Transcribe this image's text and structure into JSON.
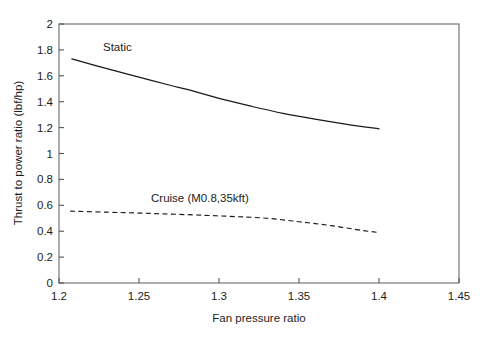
{
  "chart_data": {
    "type": "line",
    "title": "",
    "xlabel": "Fan pressure ratio",
    "ylabel": "Thrust to power ratio (lbf/hp)",
    "xlim": [
      1.2,
      1.45
    ],
    "ylim": [
      0,
      2
    ],
    "xticks": [
      "1.2",
      "1.25",
      "1.3",
      "1.35",
      "1.4",
      "1.45"
    ],
    "xtick_values": [
      1.2,
      1.25,
      1.3,
      1.35,
      1.4,
      1.45
    ],
    "yticks": [
      "0",
      "0.2",
      "0.4",
      "0.6",
      "0.8",
      "1",
      "1.2",
      "1.4",
      "1.6",
      "1.8",
      "2"
    ],
    "ytick_values": [
      0,
      0.2,
      0.4,
      0.6,
      0.8,
      1.0,
      1.2,
      1.4,
      1.6,
      1.8,
      2.0
    ],
    "grid": false,
    "legend": "inline-annotations",
    "series": [
      {
        "name": "Static",
        "style": "solid",
        "color": "#1a1a1a",
        "x": [
          1.208,
          1.23,
          1.25,
          1.27,
          1.28,
          1.3,
          1.32,
          1.34,
          1.36,
          1.38,
          1.4
        ],
        "values": [
          1.73,
          1.655,
          1.59,
          1.525,
          1.495,
          1.425,
          1.365,
          1.31,
          1.265,
          1.225,
          1.19
        ]
      },
      {
        "name": "Cruise (M0.8,35kft)",
        "style": "dashed",
        "color": "#1a1a1a",
        "x": [
          1.207,
          1.23,
          1.25,
          1.27,
          1.29,
          1.31,
          1.33,
          1.35,
          1.37,
          1.39,
          1.4
        ],
        "values": [
          0.555,
          0.547,
          0.54,
          0.532,
          0.523,
          0.513,
          0.5,
          0.473,
          0.443,
          0.405,
          0.39
        ]
      }
    ],
    "annotations": [
      {
        "text": "Static",
        "x": 1.2275,
        "y": 1.795
      },
      {
        "text": "Cruise (M0.8,35kft)",
        "x": 1.2575,
        "y": 0.625
      }
    ]
  }
}
